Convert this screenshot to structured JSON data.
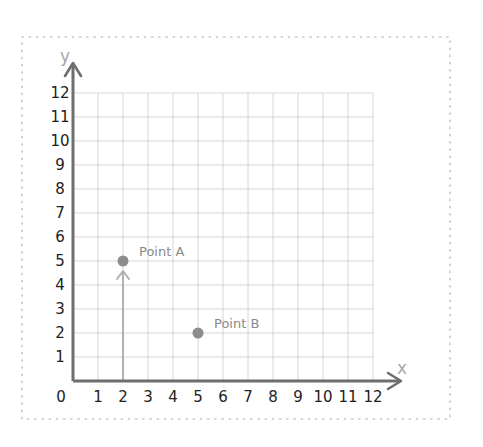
{
  "chart_data": {
    "type": "scatter",
    "title": "",
    "xlabel": "x",
    "ylabel": "y",
    "xlim": [
      0,
      12
    ],
    "ylim": [
      0,
      12
    ],
    "grid": true,
    "x_ticks": [
      "0",
      "1",
      "2",
      "3",
      "4",
      "5",
      "6",
      "7",
      "8",
      "9",
      "10",
      "11",
      "12"
    ],
    "y_ticks": [
      "1",
      "2",
      "3",
      "4",
      "5",
      "6",
      "7",
      "8",
      "9",
      "10",
      "11",
      "12"
    ],
    "series": [
      {
        "name": "Points",
        "points": [
          {
            "label": "Point A",
            "x": 2,
            "y": 5
          },
          {
            "label": "Point B",
            "x": 5,
            "y": 2
          }
        ]
      }
    ],
    "annotations": [
      {
        "type": "arrow",
        "from": [
          2,
          0
        ],
        "to": [
          2,
          5
        ],
        "description": "vertical arrow from x-axis up to Point A"
      }
    ]
  },
  "diagram": {
    "axis_x_name": "x",
    "axis_y_name": "y",
    "origin_label": "0",
    "point_a_label": "Point A",
    "point_b_label": "Point B"
  },
  "colors": {
    "axis": "#6e6e6e",
    "grid": "#d6d6d6",
    "point": "#8c8c8c",
    "arrow": "#b0b0b0",
    "border_dots": "#c4c4c4",
    "tick_text": "#222222",
    "axis_name": "#a8a8a8"
  }
}
